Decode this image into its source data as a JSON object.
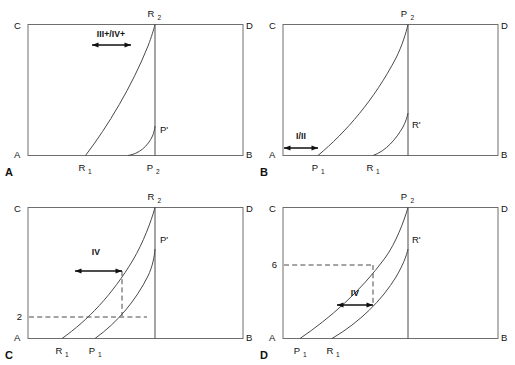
{
  "figure": {
    "type": "scientific-diagram",
    "panel_count": 4,
    "stroke_color": "#4a4a4a",
    "frame_color": "#6e6e6e",
    "text_color": "#111111",
    "background": "#ffffff"
  },
  "panels": [
    {
      "id": "A",
      "panel_label": "A",
      "corners": {
        "top_left": "C",
        "top_right": "D",
        "bottom_left": "A",
        "bottom_right": "B"
      },
      "curve_labels": [
        {
          "name": "R2",
          "base": "R",
          "sub": "2",
          "position": "top"
        },
        {
          "name": "R1",
          "base": "R",
          "sub": "1",
          "position": "bottom"
        },
        {
          "name": "P2",
          "base": "P",
          "sub": "2",
          "position": "bottom"
        },
        {
          "name": "Pprime",
          "base": "P'",
          "sub": "",
          "position": "interior"
        }
      ],
      "range_arrow": {
        "label": "III+/IV+"
      },
      "tick_label": null,
      "dashed_guides": false
    },
    {
      "id": "B",
      "panel_label": "B",
      "corners": {
        "top_left": "C",
        "top_right": "D",
        "bottom_left": "A",
        "bottom_right": "B"
      },
      "curve_labels": [
        {
          "name": "P2",
          "base": "P",
          "sub": "2",
          "position": "top"
        },
        {
          "name": "P1",
          "base": "P",
          "sub": "1",
          "position": "bottom"
        },
        {
          "name": "R1",
          "base": "R",
          "sub": "1",
          "position": "bottom"
        },
        {
          "name": "Rprime",
          "base": "R'",
          "sub": "",
          "position": "interior"
        }
      ],
      "range_arrow": {
        "label": "I/II"
      },
      "tick_label": null,
      "dashed_guides": false
    },
    {
      "id": "C",
      "panel_label": "C",
      "corners": {
        "top_left": "C",
        "top_right": "D",
        "bottom_left": "A",
        "bottom_right": "B"
      },
      "curve_labels": [
        {
          "name": "R2",
          "base": "R",
          "sub": "2",
          "position": "top"
        },
        {
          "name": "R1",
          "base": "R",
          "sub": "1",
          "position": "bottom"
        },
        {
          "name": "P1",
          "base": "P",
          "sub": "1",
          "position": "bottom"
        },
        {
          "name": "Pprime",
          "base": "P'",
          "sub": "",
          "position": "interior"
        }
      ],
      "range_arrow": {
        "label": "IV"
      },
      "tick_label": "2",
      "dashed_guides": true
    },
    {
      "id": "D",
      "panel_label": "D",
      "corners": {
        "top_left": "C",
        "top_right": "D",
        "bottom_left": "A",
        "bottom_right": "B"
      },
      "curve_labels": [
        {
          "name": "P2",
          "base": "P",
          "sub": "2",
          "position": "top"
        },
        {
          "name": "P1",
          "base": "P",
          "sub": "1",
          "position": "bottom"
        },
        {
          "name": "R1",
          "base": "R",
          "sub": "1",
          "position": "bottom"
        },
        {
          "name": "Rprime",
          "base": "R'",
          "sub": "",
          "position": "interior"
        }
      ],
      "range_arrow": {
        "label": "IV"
      },
      "tick_label": "6",
      "dashed_guides": true
    }
  ]
}
